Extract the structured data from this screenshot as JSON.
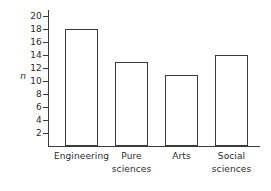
{
  "chart_data": {
    "type": "bar",
    "title": "",
    "subtitle": "",
    "xlabel": "",
    "ylabel": "n",
    "categories": [
      "Engineering",
      "Pure sciences",
      "Arts",
      "Social sciences"
    ],
    "values": [
      18,
      13,
      11,
      14
    ],
    "ylim": [
      0,
      21
    ],
    "yticks": [
      2,
      4,
      6,
      8,
      10,
      12,
      14,
      16,
      18,
      20
    ],
    "ytick_labels": [
      "2",
      "4",
      "6",
      "8",
      "10",
      "12",
      "14",
      "16",
      "18",
      "20"
    ],
    "grid": false,
    "legend": false,
    "legend_position": "none",
    "bar_fill_color": "#ffffff",
    "bar_edge_color": "#3a3a3a",
    "axis_color": "#3a3a3a",
    "background_color": "#ffffff",
    "series": [
      {
        "name": "n",
        "values": [
          18,
          13,
          11,
          14
        ]
      }
    ],
    "annotations": []
  },
  "axes": {
    "y": {
      "label": "n",
      "ticks": [
        {
          "value": 20,
          "label": "20"
        },
        {
          "value": 18,
          "label": "18"
        },
        {
          "value": 16,
          "label": "16"
        },
        {
          "value": 14,
          "label": "14"
        },
        {
          "value": 12,
          "label": "12"
        },
        {
          "value": 10,
          "label": "10"
        },
        {
          "value": 8,
          "label": "8"
        },
        {
          "value": 6,
          "label": "6"
        },
        {
          "value": 4,
          "label": "4"
        },
        {
          "value": 2,
          "label": "2"
        }
      ]
    },
    "x": {
      "label": "",
      "categories": [
        {
          "line1": "Engineering",
          "line2": ""
        },
        {
          "line1": "Pure",
          "line2": "sciences"
        },
        {
          "line1": "Arts",
          "line2": ""
        },
        {
          "line1": "Social",
          "line2": "sciences"
        }
      ]
    }
  }
}
